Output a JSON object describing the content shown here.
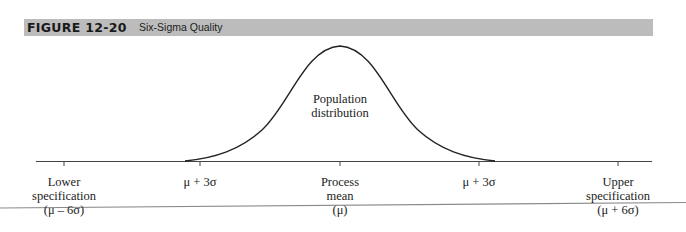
{
  "figure": {
    "number": "FIGURE 12-20",
    "title": "Six-Sigma Quality"
  },
  "curve_label": [
    "Population",
    "distribution"
  ],
  "axis_labels": {
    "lower_spec": [
      "Lower",
      "specification",
      "(μ – 6σ)"
    ],
    "left_sigma": [
      "μ + 3σ"
    ],
    "mean": [
      "Process",
      "mean",
      "(μ)"
    ],
    "right_sigma": [
      "μ + 3σ"
    ],
    "upper_spec": [
      "Upper",
      "specification",
      "(μ + 6σ)"
    ]
  },
  "colors": {
    "header_bg": "#bcbcbc",
    "line": "#333333",
    "rule": "#888888"
  }
}
